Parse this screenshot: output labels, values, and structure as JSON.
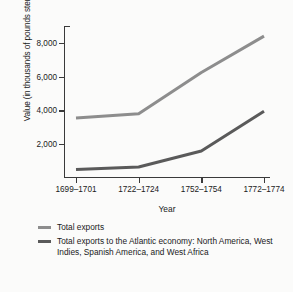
{
  "chart_data": {
    "type": "line",
    "title": "",
    "xlabel": "Year",
    "ylabel": "Value (in thousands of pounds sterling)",
    "categories": [
      "1699–1701",
      "1722–1724",
      "1752–1754",
      "1772–1774"
    ],
    "ylim": [
      0,
      9000
    ],
    "yticks": [
      2000,
      4000,
      6000,
      8000
    ],
    "ytick_labels": [
      "2,000",
      "4,000",
      "6,000",
      "8,000"
    ],
    "grid": false,
    "legend_position": "below",
    "series": [
      {
        "name": "Total exports",
        "color": "#8d8d8d",
        "values": [
          3550,
          3800,
          6250,
          8400
        ]
      },
      {
        "name": "Total exports to the Atlantic economy: North America, West Indies, Spanish America, and West Africa",
        "color": "#5a5a5a",
        "values": [
          500,
          650,
          1600,
          3950
        ]
      }
    ]
  },
  "axes": {
    "ylabel": "Value (in thousands of pounds sterling)",
    "xlabel": "Year",
    "ytick_labels": [
      "2,000",
      "4,000",
      "6,000",
      "8,000"
    ],
    "xtick_labels": [
      "1699–1701",
      "1722–1724",
      "1752–1754",
      "1772–1774"
    ]
  },
  "legend": {
    "items": [
      {
        "label": "Total exports",
        "color": "#8d8d8d"
      },
      {
        "label": "Total exports to the Atlantic economy: North America, West Indies, Spanish America, and West Africa",
        "color": "#5a5a5a"
      }
    ]
  },
  "colors": {
    "background": "#fbfbfa",
    "axis": "#3a3a3a",
    "text": "#1a1a1a",
    "series_total_exports": "#8d8d8d",
    "series_atlantic": "#5a5a5a"
  }
}
